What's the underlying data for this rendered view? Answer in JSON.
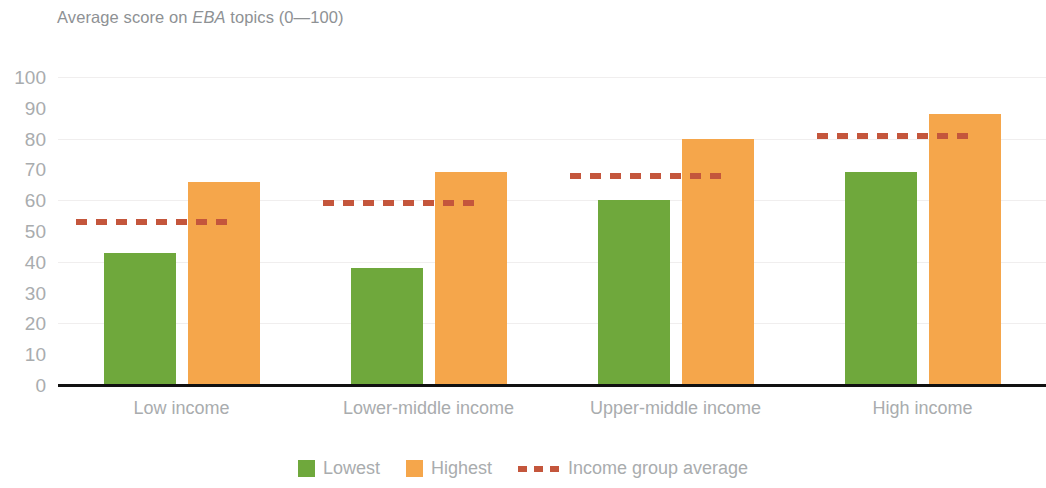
{
  "chart_data": {
    "type": "bar",
    "title": "Average score on EBA topics (0—100)",
    "title_prefix": "Average score on ",
    "title_emphasis": "EBA",
    "title_suffix": " topics (0—100)",
    "xlabel": "",
    "ylabel": "",
    "ylim": [
      0,
      100
    ],
    "yticks": [
      100,
      90,
      80,
      70,
      60,
      50,
      40,
      30,
      20,
      10,
      0
    ],
    "grid": true,
    "grid_values": [
      100,
      80,
      60,
      40,
      20
    ],
    "legend_position": "bottom-center",
    "categories": [
      "Low income",
      "Lower-middle income",
      "Upper-middle income",
      "High income"
    ],
    "series": [
      {
        "name": "Lowest",
        "color": "#6fa83c",
        "values": [
          43,
          38,
          60,
          69
        ]
      },
      {
        "name": "Highest",
        "color": "#f5a64b",
        "values": [
          66,
          69,
          80,
          88
        ]
      }
    ],
    "reference_series": {
      "name": "Income group average",
      "color": "#c4563c",
      "style": "dashed",
      "values": [
        53,
        59,
        68,
        81
      ]
    }
  },
  "axis": {
    "ticks": [
      "100",
      "90",
      "80",
      "70",
      "60",
      "50",
      "40",
      "30",
      "20",
      "10",
      "0"
    ]
  },
  "legend": {
    "items": [
      {
        "label": "Lowest",
        "kind": "swatch",
        "color": "#6fa83c"
      },
      {
        "label": "Highest",
        "kind": "swatch",
        "color": "#f5a64b"
      },
      {
        "label": "Income group average",
        "kind": "dash",
        "color": "#c4563c"
      }
    ]
  },
  "colors": {
    "lowest": "#6fa83c",
    "highest": "#f5a64b",
    "average": "#c4563c",
    "text": "#a9acae",
    "title": "#8e9194",
    "grid": "#f0eeee",
    "axis": "#111111",
    "background": "#ffffff"
  }
}
